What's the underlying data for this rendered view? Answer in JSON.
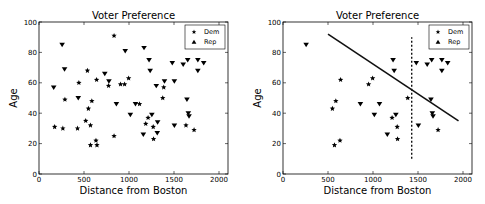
{
  "chart_data": [
    {
      "type": "scatter",
      "title": "Voter Preference",
      "xlabel": "Distance from Boston",
      "ylabel": "Age",
      "xlim": [
        0,
        2100
      ],
      "ylim": [
        0,
        100
      ],
      "xticks": [
        0,
        500,
        1000,
        1500,
        2000
      ],
      "yticks": [
        0,
        20,
        40,
        60,
        80,
        100
      ],
      "grid": false,
      "legend": {
        "position": "upper right",
        "entries": [
          {
            "label": "Dem",
            "marker": "star"
          },
          {
            "label": "Rep",
            "marker": "triangle"
          }
        ]
      },
      "series": [
        {
          "name": "Dem",
          "marker": "star",
          "points": [
            [
              174,
              31
            ],
            [
              265,
              30
            ],
            [
              428,
              30
            ],
            [
              288,
              49
            ],
            [
              443,
              60
            ],
            [
              538,
              68
            ],
            [
              549,
              43
            ],
            [
              519,
              35
            ],
            [
              572,
              32
            ],
            [
              587,
              48
            ],
            [
              633,
              22
            ],
            [
              644,
              19
            ],
            [
              572,
              19
            ],
            [
              640,
              62
            ],
            [
              773,
              58
            ],
            [
              834,
              91
            ],
            [
              834,
              25
            ],
            [
              906,
              59
            ],
            [
              951,
              59
            ],
            [
              996,
              63
            ],
            [
              1117,
              46
            ],
            [
              1212,
              37
            ],
            [
              1186,
              33
            ],
            [
              1269,
              31
            ],
            [
              1273,
              23
            ],
            [
              1386,
              57
            ],
            [
              1375,
              50
            ],
            [
              1633,
              32
            ],
            [
              1723,
              29
            ]
          ]
        },
        {
          "name": "Rep",
          "marker": "triangle_down",
          "points": [
            [
              163,
              57
            ],
            [
              257,
              85
            ],
            [
              284,
              69
            ],
            [
              436,
              50
            ],
            [
              731,
              66
            ],
            [
              777,
              61
            ],
            [
              860,
              46
            ],
            [
              958,
              81
            ],
            [
              1015,
              39
            ],
            [
              1072,
              46
            ],
            [
              1167,
              83
            ],
            [
              1223,
              75
            ],
            [
              1235,
              68
            ],
            [
              1254,
              39
            ],
            [
              1303,
              58
            ],
            [
              1318,
              34
            ],
            [
              1314,
              27
            ],
            [
              1394,
              61
            ],
            [
              1159,
              26
            ],
            [
              1481,
              73
            ],
            [
              1504,
              61
            ],
            [
              1504,
              32
            ],
            [
              1602,
              72
            ],
            [
              1652,
              75
            ],
            [
              1644,
              49
            ],
            [
              1659,
              40
            ],
            [
              1667,
              38
            ],
            [
              1765,
              75
            ],
            [
              1765,
              68
            ],
            [
              1830,
              73
            ]
          ]
        }
      ]
    },
    {
      "type": "scatter",
      "title": "Voter Preference",
      "xlabel": "Distance from Boston",
      "ylabel": "Age",
      "xlim": [
        0,
        2100
      ],
      "ylim": [
        0,
        100
      ],
      "xticks": [
        0,
        500,
        1000,
        1500,
        2000
      ],
      "yticks": [
        0,
        20,
        40,
        60,
        80,
        100
      ],
      "grid": false,
      "legend": {
        "position": "upper right",
        "entries": [
          {
            "label": "Dem",
            "marker": "star"
          },
          {
            "label": "Rep",
            "marker": "triangle"
          }
        ]
      },
      "series": [
        {
          "name": "Dem",
          "marker": "star",
          "points": [
            [
              549,
              43
            ],
            [
              587,
              48
            ],
            [
              572,
              19
            ],
            [
              633,
              22
            ],
            [
              640,
              62
            ],
            [
              951,
              59
            ],
            [
              996,
              63
            ],
            [
              1212,
              37
            ],
            [
              1269,
              31
            ],
            [
              1273,
              23
            ],
            [
              1386,
              50
            ],
            [
              1723,
              29
            ]
          ]
        },
        {
          "name": "Rep",
          "marker": "triangle_down",
          "points": [
            [
              257,
              85
            ],
            [
              860,
              46
            ],
            [
              1015,
              39
            ],
            [
              1072,
              46
            ],
            [
              1223,
              75
            ],
            [
              1235,
              68
            ],
            [
              1254,
              39
            ],
            [
              1159,
              26
            ],
            [
              1481,
              73
            ],
            [
              1504,
              32
            ],
            [
              1602,
              72
            ],
            [
              1652,
              75
            ],
            [
              1644,
              49
            ],
            [
              1659,
              40
            ],
            [
              1667,
              38
            ],
            [
              1765,
              75
            ],
            [
              1765,
              68
            ],
            [
              1830,
              73
            ]
          ]
        }
      ],
      "annotations": [
        {
          "type": "line",
          "style": "solid",
          "from": [
            500,
            92
          ],
          "to": [
            1950,
            35
          ]
        },
        {
          "type": "vline",
          "style": "dashed",
          "x": 1430,
          "from_y": 10,
          "to_y": 90
        }
      ]
    }
  ]
}
